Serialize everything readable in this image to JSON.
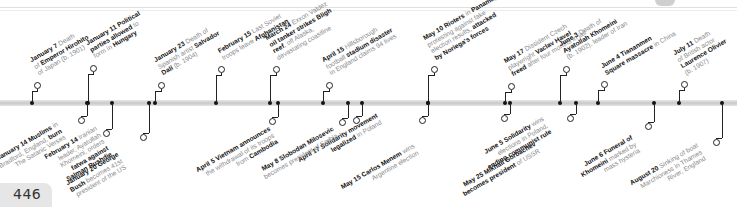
{
  "page_number": "446",
  "events_above": [
    {
      "date": "January 7",
      "lines": [
        [
          "b:January 7",
          " Death"
        ],
        [
          "of ",
          "b:Emperor Hirohito"
        ],
        [
          "of Japan (b. 1901)"
        ]
      ]
    },
    {
      "date": "January 11",
      "lines": [
        [
          "b:January 11 Political"
        ],
        [
          "b:parties allowed",
          " to"
        ],
        [
          "form in ",
          "b:Hungary"
        ]
      ]
    },
    {
      "date": "January 23",
      "lines": [
        [
          "b:January 23",
          " Death of"
        ],
        [
          "Spanish artist ",
          "b:Salvador"
        ],
        [
          "b:Dalí",
          " (b. 1904)"
        ]
      ]
    },
    {
      "date": "February 15",
      "lines": [
        [
          "b:February 15",
          " Last Soviet"
        ],
        [
          "troops leave ",
          "b:Afghanistan"
        ]
      ]
    },
    {
      "date": "March 24",
      "lines": [
        [
          "b:March 24",
          " Exxon Valdez"
        ],
        [
          "b:oil tanker strikes Bligh"
        ],
        [
          "b:reef",
          ", off Alaska,"
        ],
        [
          "devastating coastline"
        ]
      ]
    },
    {
      "date": "April 15",
      "lines": [
        [
          "b:April 15",
          " Hillsborough"
        ],
        [
          "football ",
          "b:stadium disaster"
        ],
        [
          "in England claims 94 lives"
        ]
      ]
    },
    {
      "date": "May 10",
      "lines": [
        [
          "b:May 10 Rioters",
          " in ",
          "b:Panama,"
        ],
        [
          "protesting against fake"
        ],
        [
          "election results, ",
          "b:attacked"
        ],
        [
          "b:by Noriega's forces"
        ]
      ]
    },
    {
      "date": "May 17",
      "lines": [
        [
          "b:May 17",
          " Dissident Czech"
        ],
        [
          "playwright ",
          "b:Vaclav Havel"
        ],
        [
          "b:freed",
          " after four months in jail"
        ]
      ]
    },
    {
      "date": "June 3",
      "lines": [
        [
          "b:June 3",
          " Death of"
        ],
        [
          "b:Ayatollah Khomeini"
        ],
        [
          "(b. 1902), leader of Iran"
        ]
      ]
    },
    {
      "date": "June 4",
      "lines": [
        [
          "b:June 4 Tiananmen"
        ],
        [
          "b:Square massacre",
          " in China"
        ]
      ]
    },
    {
      "date": "July 11",
      "lines": [
        [
          "b:July 11",
          " Death"
        ],
        [
          "of British actor"
        ],
        [
          "b:Laurence Olivier"
        ],
        [
          "(b. 1907)"
        ]
      ]
    }
  ],
  "events_below": [
    {
      "date": "January 14",
      "lines": [
        [
          "b:January 14 Muslims",
          " in"
        ],
        [
          "Bradford, England, ",
          "b:burn"
        ],
        [
          "The Satanic Verses"
        ]
      ]
    },
    {
      "date": "January 20",
      "lines": [
        [
          "b:January 20 George"
        ],
        [
          "b:Bush",
          " becomes 41st"
        ],
        [
          "president of the US"
        ]
      ]
    },
    {
      "date": "February 14",
      "lines": [
        [
          "b:February 14",
          " Iranian"
        ],
        [
          "leader, Ayatollah"
        ],
        [
          "Khomeini, orders"
        ],
        [
          "b:fatwa against"
        ],
        [
          "b:Salman Rushdie"
        ]
      ]
    },
    {
      "date": "April 5",
      "lines": [
        [
          "b:April 5 Vietnam announces"
        ],
        [
          "the withdrawal of its troops"
        ],
        [
          "from ",
          "b:Cambodia"
        ]
      ]
    },
    {
      "date": "April 17",
      "lines": [
        [
          "b:April 17 Solidarity movement"
        ],
        [
          "b:legalized",
          " in Poland"
        ]
      ]
    },
    {
      "date": "May 8",
      "lines": [
        [
          "b:May 8 Slobodan Milosevic"
        ],
        [
          "becomes president of Serbia"
        ]
      ]
    },
    {
      "date": "May 15",
      "lines": [
        [
          "b:May 15 Carlos Menem",
          " wins"
        ],
        [
          "Argentine election"
        ]
      ]
    },
    {
      "date": "May 25",
      "lines": [
        [
          "b:May 25 Mikhail Gorbachev"
        ],
        [
          "b:becomes president",
          " of USSR"
        ]
      ]
    },
    {
      "date": "June 5",
      "lines": [
        [
          "b:June 5 Solidarity",
          " wins"
        ],
        [
          "elections in Poland,"
        ],
        [
          "b:ending communist rule"
        ]
      ]
    },
    {
      "date": "June 6",
      "lines": [
        [
          "b:June 6 Funeral of"
        ],
        [
          "b:Khomeini",
          " marked by"
        ],
        [
          "mass hysteria"
        ]
      ]
    },
    {
      "date": "August 20",
      "lines": [
        [
          "b:August 20",
          " Sinking of boat"
        ],
        [
          "Marchioness in Thames"
        ],
        [
          "River, England"
        ]
      ]
    }
  ]
}
